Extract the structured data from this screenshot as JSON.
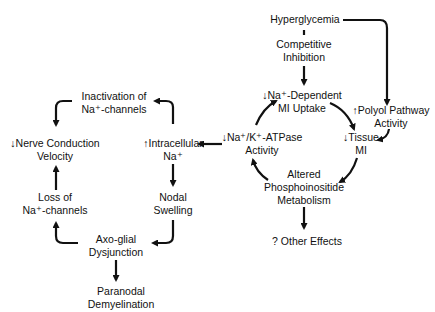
{
  "diagram": {
    "type": "flow-diagram",
    "nodes": {
      "hyperglycemia": {
        "lines": [
          "Hyperglycemia"
        ]
      },
      "competitive_inhibition": {
        "lines": [
          "Competitive",
          "Inhibition"
        ]
      },
      "na_dependent_mi_uptake": {
        "lines": [
          "↓Na⁺-Dependent",
          "MI Uptake"
        ]
      },
      "polyol_pathway": {
        "lines": [
          "↑Polyol Pathway",
          "Activity"
        ]
      },
      "tissue_mi": {
        "lines": [
          "↓Tissue",
          "MI"
        ]
      },
      "na_k_atpase": {
        "lines": [
          "↓Na⁺/K⁺-ATPase",
          "Activity"
        ]
      },
      "phosphoinositide": {
        "lines": [
          "Altered",
          "Phosphoinositide",
          "Metabolism"
        ]
      },
      "other_effects": {
        "lines": [
          "? Other Effects"
        ]
      },
      "intracellular_na": {
        "lines": [
          "↑Intracellular",
          "Na⁺"
        ]
      },
      "inactivation_na_channels": {
        "lines": [
          "Inactivation of",
          "Na⁺-channels"
        ]
      },
      "nerve_conduction": {
        "lines": [
          "↓Nerve Conduction",
          "Velocity"
        ]
      },
      "loss_na_channels": {
        "lines": [
          "Loss of",
          "Na⁺-channels"
        ]
      },
      "nodal_swelling": {
        "lines": [
          "Nodal",
          "Swelling"
        ]
      },
      "axo_glial": {
        "lines": [
          "Axo-glial",
          "Dysjunction"
        ]
      },
      "paranodal": {
        "lines": [
          "Paranodal",
          "Demyelination"
        ]
      }
    },
    "edges": [
      {
        "from": "hyperglycemia",
        "to": "competitive_inhibition",
        "style": "dashed-line"
      },
      {
        "from": "competitive_inhibition",
        "to": "na_dependent_mi_uptake"
      },
      {
        "from": "hyperglycemia",
        "to": "polyol_pathway"
      },
      {
        "from": "na_dependent_mi_uptake",
        "to": "tissue_mi"
      },
      {
        "from": "polyol_pathway",
        "to": "tissue_mi"
      },
      {
        "from": "tissue_mi",
        "to": "phosphoinositide"
      },
      {
        "from": "phosphoinositide",
        "to": "na_k_atpase"
      },
      {
        "from": "na_k_atpase",
        "to": "na_dependent_mi_uptake"
      },
      {
        "from": "phosphoinositide",
        "to": "other_effects"
      },
      {
        "from": "na_k_atpase",
        "to": "intracellular_na"
      },
      {
        "from": "intracellular_na",
        "to": "inactivation_na_channels"
      },
      {
        "from": "inactivation_na_channels",
        "to": "nerve_conduction"
      },
      {
        "from": "intracellular_na",
        "to": "nodal_swelling"
      },
      {
        "from": "nodal_swelling",
        "to": "axo_glial"
      },
      {
        "from": "axo_glial",
        "to": "loss_na_channels"
      },
      {
        "from": "loss_na_channels",
        "to": "nerve_conduction"
      },
      {
        "from": "axo_glial",
        "to": "paranodal"
      }
    ]
  }
}
